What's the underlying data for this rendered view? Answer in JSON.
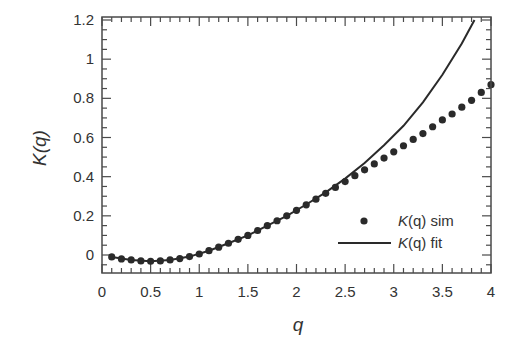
{
  "chart_data": {
    "type": "scatter",
    "title": "",
    "xlabel": "q",
    "ylabel": "K(q)",
    "xlim": [
      0,
      4
    ],
    "ylim": [
      -0.12,
      1.22
    ],
    "x_ticks": [
      0,
      0.5,
      1,
      1.5,
      2,
      2.5,
      3,
      3.5,
      4
    ],
    "x_tick_labels": [
      "0",
      "0.5",
      "1",
      "1.5",
      "2",
      "2.5",
      "3",
      "3.5",
      "4"
    ],
    "y_ticks": [
      0,
      0.2,
      0.4,
      0.6,
      0.8,
      1,
      1.2
    ],
    "y_tick_labels": [
      "0",
      "0.2",
      "0.4",
      "0.6",
      "0.8",
      "1",
      "1.2"
    ],
    "grid": false,
    "legend_position": "lower right",
    "series": [
      {
        "name": "K(q) sim",
        "style": "markers",
        "x": [
          0.1,
          0.2,
          0.3,
          0.4,
          0.5,
          0.6,
          0.7,
          0.8,
          0.9,
          1.0,
          1.1,
          1.2,
          1.3,
          1.4,
          1.5,
          1.6,
          1.7,
          1.8,
          1.9,
          2.0,
          2.1,
          2.2,
          2.3,
          2.4,
          2.5,
          2.6,
          2.7,
          2.8,
          2.9,
          3.0,
          3.1,
          3.2,
          3.3,
          3.4,
          3.5,
          3.6,
          3.7,
          3.8,
          3.9,
          4.0
        ],
        "values": [
          -0.01,
          -0.02,
          -0.025,
          -0.03,
          -0.032,
          -0.03,
          -0.025,
          -0.018,
          -0.008,
          0.005,
          0.022,
          0.04,
          0.06,
          0.08,
          0.1,
          0.125,
          0.15,
          0.175,
          0.2,
          0.228,
          0.256,
          0.285,
          0.315,
          0.345,
          0.375,
          0.405,
          0.435,
          0.465,
          0.495,
          0.527,
          0.558,
          0.59,
          0.62,
          0.655,
          0.69,
          0.72,
          0.755,
          0.79,
          0.83,
          0.87
        ]
      },
      {
        "name": "K(q) fit",
        "style": "line",
        "x": [
          0.1,
          0.3,
          0.5,
          0.7,
          0.9,
          1.1,
          1.3,
          1.5,
          1.7,
          1.9,
          2.1,
          2.3,
          2.5,
          2.7,
          2.9,
          3.1,
          3.3,
          3.5,
          3.7,
          3.83
        ],
        "values": [
          -0.01,
          -0.025,
          -0.032,
          -0.025,
          -0.008,
          0.022,
          0.06,
          0.1,
          0.15,
          0.2,
          0.258,
          0.32,
          0.39,
          0.47,
          0.56,
          0.66,
          0.78,
          0.92,
          1.08,
          1.2
        ]
      }
    ],
    "legend": [
      {
        "label_italic": "K",
        "label_rest": "(q) sim",
        "marker": "dot"
      },
      {
        "label_italic": "K",
        "label_rest": "(q) fit",
        "marker": "line"
      }
    ]
  },
  "axes": {
    "x_label": "q",
    "y_label": "K(q)"
  },
  "colors": {
    "ink": "#2a2a2a",
    "frame": "#4a4a4a",
    "background": "#ffffff"
  }
}
